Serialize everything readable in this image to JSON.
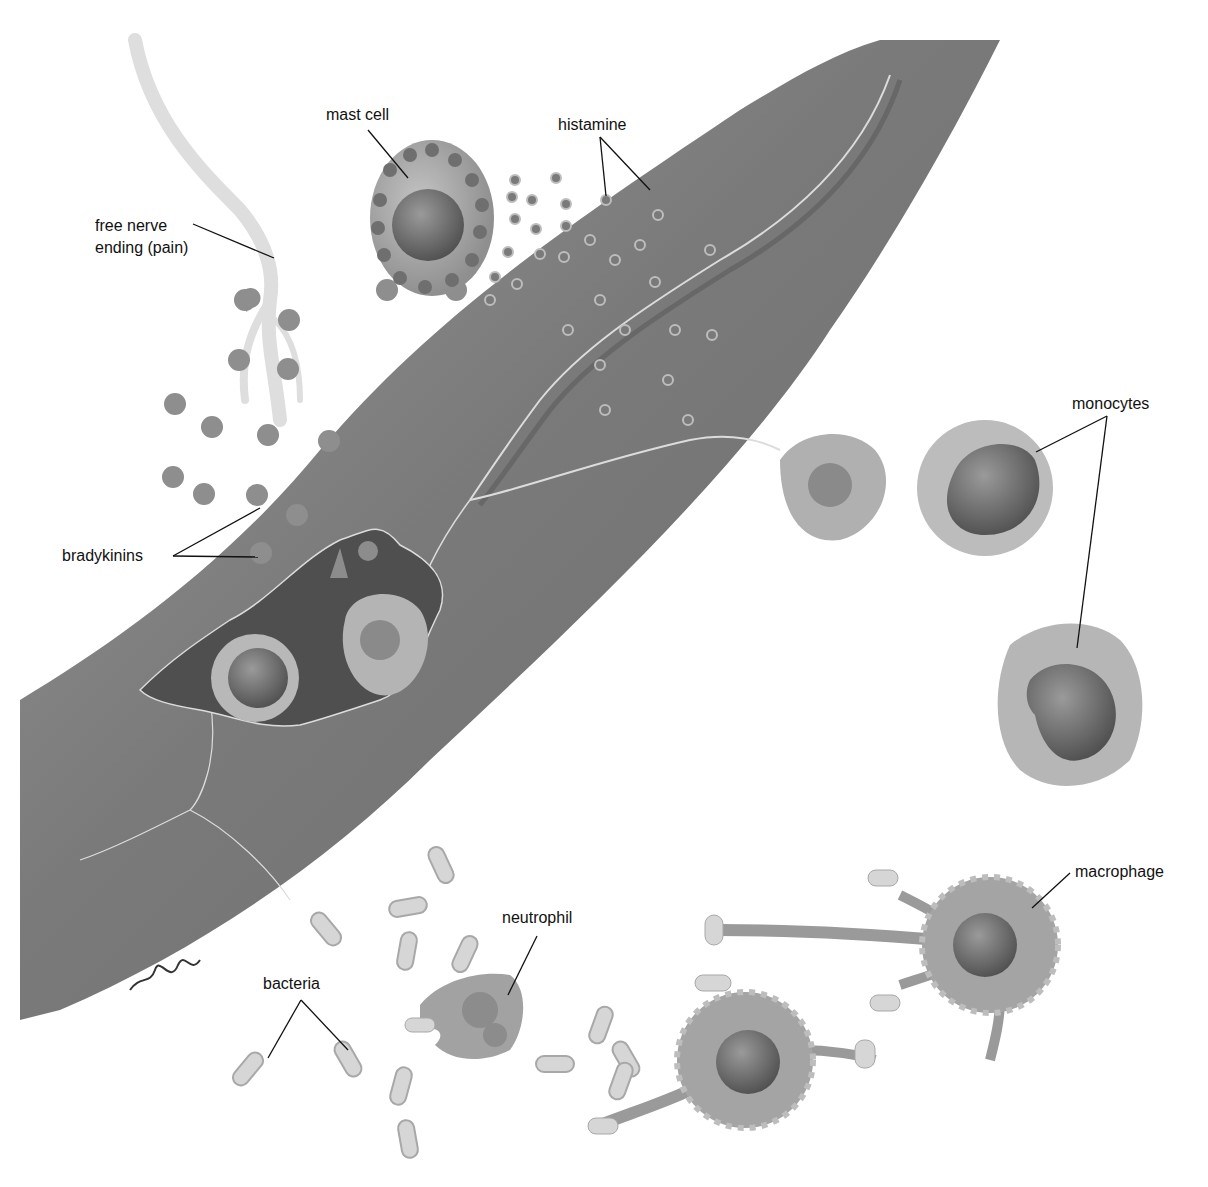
{
  "diagram": {
    "colors": {
      "background": "#ffffff",
      "vessel": "#7d7d7d",
      "vessel_dark": "#5e5e5e",
      "cell_fill": "#a9a9a9",
      "nucleus": "#5a5a5a",
      "bacteria": "#d4d4d4",
      "nerve": "#dcdcdc",
      "label_text": "#111111"
    },
    "labels": {
      "mast_cell": "mast cell",
      "histamine": "histamine",
      "free_nerve_line1": "free nerve",
      "free_nerve_line2": "ending (pain)",
      "bradykinins": "bradykinins",
      "monocytes": "monocytes",
      "macrophage": "macrophage",
      "neutrophil": "neutrophil",
      "bacteria": "bacteria"
    },
    "signature": "artist signature"
  }
}
